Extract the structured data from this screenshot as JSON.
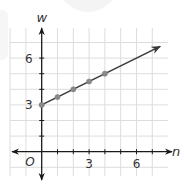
{
  "chart_data": {
    "type": "line",
    "title": "",
    "xlabel": "n",
    "ylabel": "w",
    "origin_label": "O",
    "x_ticks": [
      3,
      6
    ],
    "y_ticks": [
      3,
      6
    ],
    "xlim": [
      -1.5,
      8.0
    ],
    "ylim": [
      -1.5,
      8.0
    ],
    "grid": true,
    "series": [
      {
        "name": "w = 3 + 0.5n",
        "points": [
          {
            "x": 0,
            "y": 3
          },
          {
            "x": 1,
            "y": 3.5
          },
          {
            "x": 2,
            "y": 4
          },
          {
            "x": 3,
            "y": 4.5
          },
          {
            "x": 4,
            "y": 5
          }
        ],
        "ray_end": {
          "x": 7.5,
          "y": 6.75
        },
        "line_color": "#3a3a3a",
        "point_color": "#8a8a8a"
      }
    ]
  },
  "colors": {
    "grid": "#dddddd",
    "axis": "#1a1a1a",
    "text": "#333333"
  }
}
